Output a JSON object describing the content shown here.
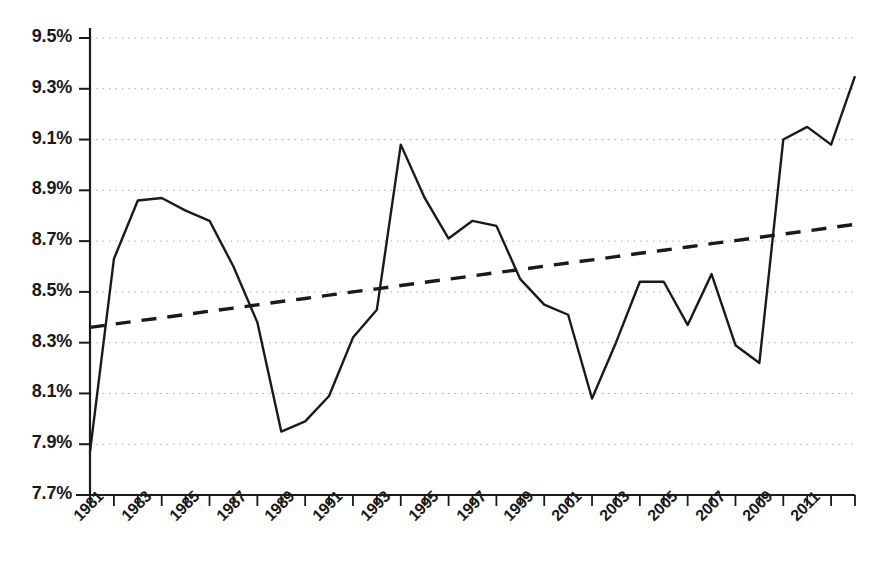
{
  "chart_data": {
    "type": "line",
    "title": "",
    "subtitle": "",
    "xlabel": "",
    "ylabel": "",
    "grid": true,
    "legend_position": "none",
    "xlim": [
      1981,
      2013
    ],
    "ylim": [
      7.7,
      9.5
    ],
    "y_tick_labels": [
      "9.5%",
      "9.3%",
      "9.1%",
      "8.9%",
      "8.7%",
      "8.5%",
      "8.3%",
      "8.1%",
      "7.9%",
      "7.7%"
    ],
    "y_tick_values": [
      9.5,
      9.3,
      9.1,
      8.9,
      8.7,
      8.5,
      8.3,
      8.1,
      7.9,
      7.7
    ],
    "x_tick_labels": [
      "1981",
      "1983",
      "1985",
      "1987",
      "1989",
      "1991",
      "1993",
      "1995",
      "1997",
      "1999",
      "2001",
      "2003",
      "2005",
      "2007",
      "2009",
      "2011"
    ],
    "x_tick_values": [
      1981,
      1983,
      1985,
      1987,
      1989,
      1991,
      1993,
      1995,
      1997,
      1999,
      2001,
      2003,
      2005,
      2007,
      2009,
      2011
    ],
    "x": [
      1981,
      1982,
      1983,
      1984,
      1985,
      1986,
      1987,
      1988,
      1989,
      1990,
      1991,
      1992,
      1993,
      1994,
      1995,
      1996,
      1997,
      1998,
      1999,
      2000,
      2001,
      2002,
      2003,
      2004,
      2005,
      2006,
      2007,
      2008,
      2009,
      2010,
      2011,
      2012,
      2013
    ],
    "series": [
      {
        "name": "series",
        "style": "solid",
        "color": "#1a1a1a",
        "values": [
          7.87,
          8.63,
          8.86,
          8.87,
          8.82,
          8.78,
          8.6,
          8.38,
          7.95,
          7.99,
          8.09,
          8.32,
          8.43,
          9.08,
          8.87,
          8.71,
          8.78,
          8.76,
          8.55,
          8.45,
          8.41,
          8.08,
          8.3,
          8.54,
          8.54,
          8.37,
          8.57,
          8.29,
          8.22,
          9.1,
          9.15,
          9.08,
          9.35
        ]
      },
      {
        "name": "trend",
        "style": "dashed",
        "color": "#1a1a1a",
        "values": [
          8.36,
          8.373,
          8.386,
          8.398,
          8.411,
          8.424,
          8.436,
          8.449,
          8.462,
          8.474,
          8.487,
          8.5,
          8.512,
          8.525,
          8.538,
          8.55,
          8.563,
          8.576,
          8.588,
          8.601,
          8.614,
          8.626,
          8.639,
          8.652,
          8.664,
          8.677,
          8.69,
          8.702,
          8.715,
          8.728,
          8.74,
          8.753,
          8.766
        ]
      }
    ]
  }
}
